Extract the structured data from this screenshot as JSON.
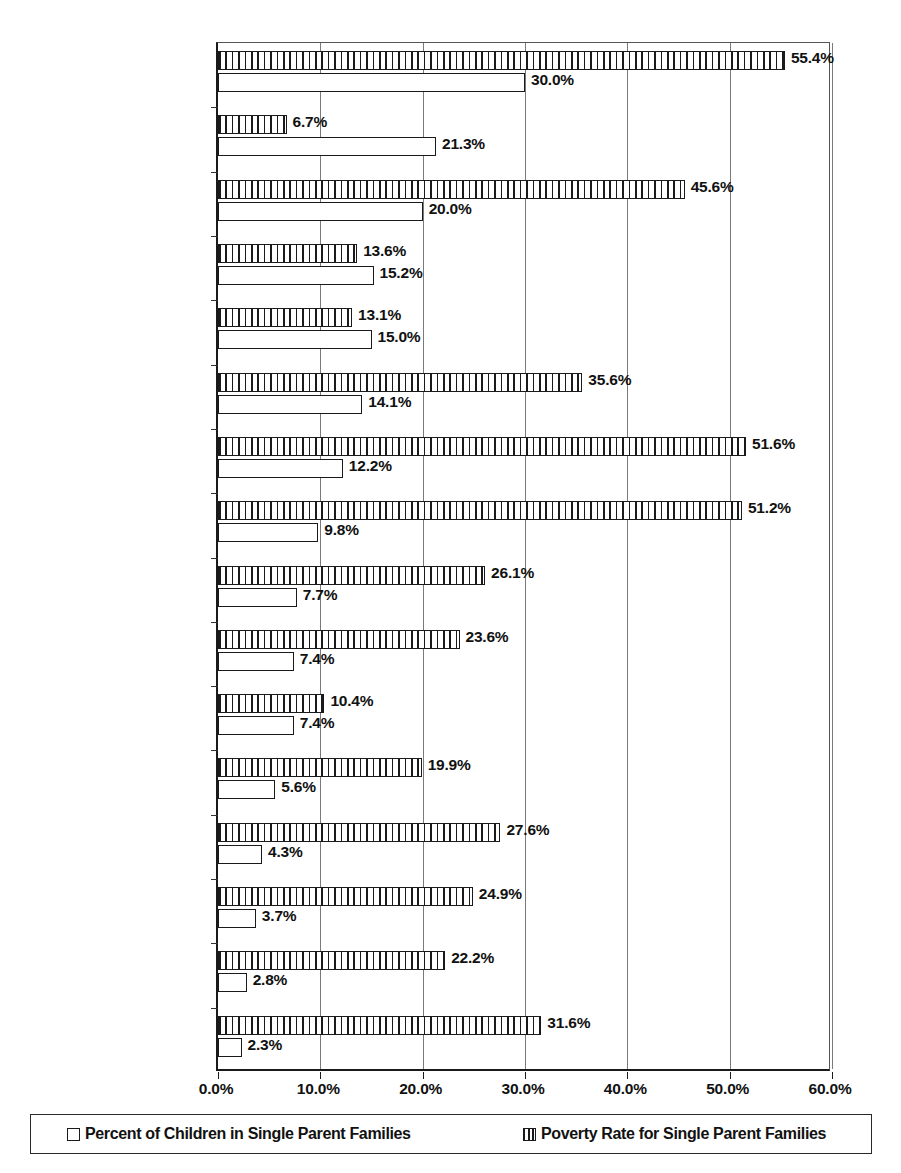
{
  "chart_data": {
    "type": "bar",
    "title": "",
    "subtitle": "",
    "xlabel": "",
    "ylabel": "",
    "orientation": "horizontal",
    "xlim": [
      0,
      60
    ],
    "xtick_labels": [
      "0.0%",
      "10.0%",
      "20.0%",
      "30.0%",
      "40.0%",
      "50.0%",
      "60.0%"
    ],
    "xticks": [
      0,
      10,
      20,
      30,
      40,
      50,
      60
    ],
    "grid": true,
    "legend_position": "bottom",
    "categories": [
      "United States",
      "Sweden",
      "United Kingdom",
      "Denmark",
      "Norway",
      "Australia",
      "Canada",
      "Germany",
      "France",
      "Netherlands",
      "Hungary",
      "Poland",
      "Mexico",
      "Greece",
      "Italy",
      "Spain"
    ],
    "series": [
      {
        "name": "Poverty Rate for Single Parent Families",
        "style": "hatched",
        "values": [
          55.4,
          6.7,
          45.6,
          13.6,
          13.1,
          35.6,
          51.6,
          51.2,
          26.1,
          23.6,
          10.4,
          19.9,
          27.6,
          24.9,
          22.2,
          31.6
        ],
        "labels": [
          "55.4%",
          "6.7%",
          "45.6%",
          "13.6%",
          "13.1%",
          "35.6%",
          "51.6%",
          "51.2%",
          "26.1%",
          "23.6%",
          "10.4%",
          "19.9%",
          "27.6%",
          "24.9%",
          "22.2%",
          "31.6%"
        ]
      },
      {
        "name": "Percent of Children in Single Parent Families",
        "style": "plain",
        "values": [
          30.0,
          21.3,
          20.0,
          15.2,
          15.0,
          14.1,
          12.2,
          9.8,
          7.7,
          7.4,
          7.4,
          5.6,
          4.3,
          3.7,
          2.8,
          2.3
        ],
        "labels": [
          "30.0%",
          "21.3%",
          "20.0%",
          "15.2%",
          "15.0%",
          "14.1%",
          "12.2%",
          "9.8%",
          "7.7%",
          "7.4%",
          "7.4%",
          "5.6%",
          "4.3%",
          "3.7%",
          "2.8%",
          "2.3%"
        ]
      }
    ]
  },
  "legend": {
    "entries": [
      {
        "label": "Percent of Children in Single Parent Families",
        "style": "plain"
      },
      {
        "label": "Poverty Rate for Single Parent Families",
        "style": "hatched"
      }
    ]
  },
  "colors": {
    "axis": "#1a1a1a",
    "grid": "#7a7a7a",
    "bar_outline": "#1a1a1a",
    "bar_fill": "#ffffff",
    "text": "#111111",
    "background": "#ffffff"
  }
}
